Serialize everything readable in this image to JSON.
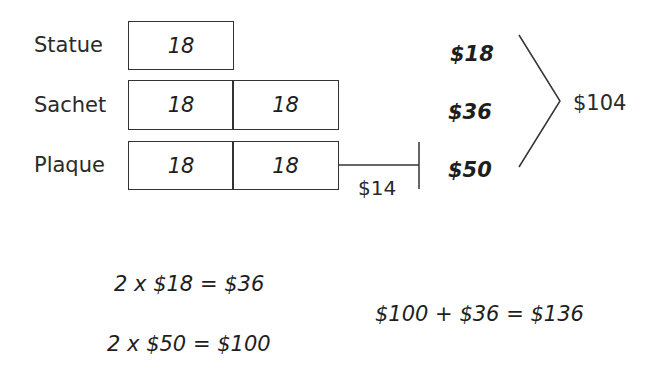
{
  "diagram": {
    "rows": [
      {
        "label": "Statue",
        "units": [
          "18"
        ],
        "total": "$18"
      },
      {
        "label": "Sachet",
        "units": [
          "18",
          "18"
        ],
        "total": "$36"
      },
      {
        "label": "Plaque",
        "units": [
          "18",
          "18"
        ],
        "extra": "$14",
        "total": "$50"
      }
    ],
    "grouped_total": "$104"
  },
  "equations": {
    "line1": "2 x $18 = $36",
    "line2": "2 x $50 = $100",
    "sum": "$100 + $36 = $136"
  },
  "colors": {
    "line": "#333333",
    "text": "#222222",
    "background": "#ffffff"
  }
}
